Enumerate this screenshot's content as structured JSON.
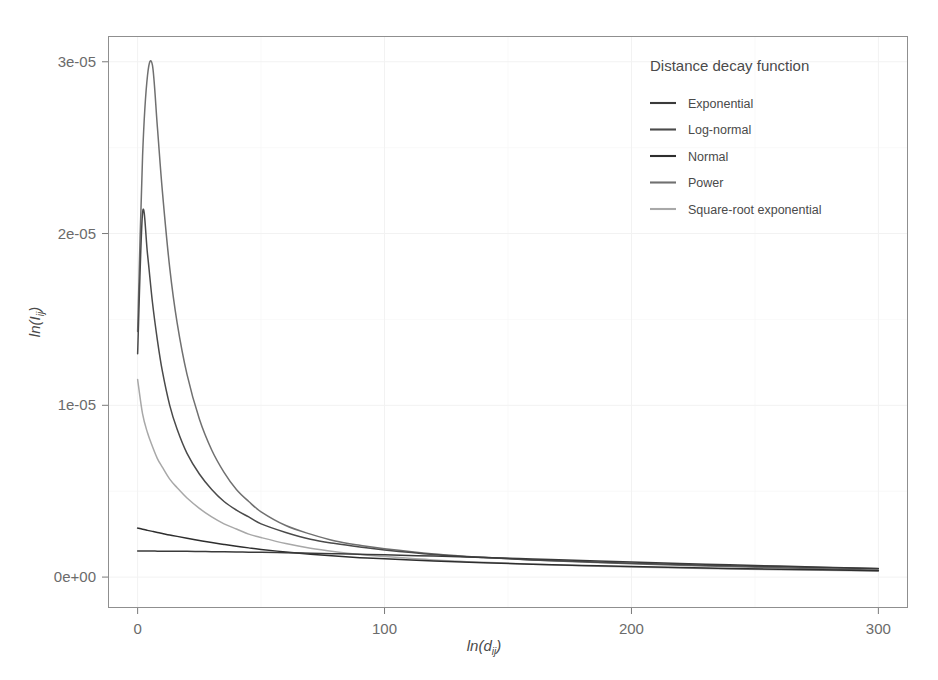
{
  "figure": {
    "background": "#ffffff",
    "panel_background": "#ffffff",
    "panel_border_color": "#8f8f8f",
    "grid_color": "#f2f2f2"
  },
  "legend": {
    "title": "Distance decay function",
    "position": "inside-top-right",
    "entries": [
      {
        "label": "Exponential",
        "color": "#3a3a3a"
      },
      {
        "label": "Log-normal",
        "color": "#4a4a4a"
      },
      {
        "label": "Normal",
        "color": "#2e2e2e"
      },
      {
        "label": "Power",
        "color": "#707070"
      },
      {
        "label": "Square-root exponential",
        "color": "#a8a8a8"
      }
    ]
  },
  "axes": {
    "x": {
      "label": "ln(d",
      "label_sub": "ij",
      "label_close": ")",
      "ticks": [
        "0",
        "100",
        "200",
        "300"
      ],
      "tick_values": [
        0,
        100,
        200,
        300
      ],
      "range": [
        -12,
        312
      ]
    },
    "y": {
      "label": "ln(I",
      "label_sub": "ij",
      "label_close": ")",
      "ticks": [
        "0e+00",
        "1e-05",
        "2e-05",
        "3e-05"
      ],
      "tick_values": [
        0,
        1e-05,
        2e-05,
        3e-05
      ],
      "range": [
        -1.8e-06,
        3.15e-05
      ]
    }
  },
  "chart_data": {
    "type": "line",
    "title": "",
    "xlabel": "ln(d_ij)",
    "ylabel": "ln(I_ij)",
    "xlim": [
      -12,
      312
    ],
    "ylim": [
      -1.8e-06,
      3.15e-05
    ],
    "grid": true,
    "legend_position": "inside-top-right",
    "legend_title": "Distance decay function",
    "x": [
      0,
      2,
      4,
      6,
      8,
      10,
      13,
      16,
      20,
      25,
      30,
      35,
      40,
      45,
      50,
      60,
      70,
      80,
      90,
      100,
      120,
      140,
      160,
      180,
      200,
      230,
      260,
      300
    ],
    "series": [
      {
        "name": "Power",
        "color": "#707070",
        "values": [
          1.43e-05,
          2.45e-05,
          2.92e-05,
          2.98e-05,
          2.62e-05,
          2.25e-05,
          1.8e-05,
          1.48e-05,
          1.18e-05,
          9.2e-06,
          7.4e-06,
          6.1e-06,
          5.1e-06,
          4.4e-06,
          3.8e-06,
          3e-06,
          2.5e-06,
          2.1e-06,
          1.85e-06,
          1.65e-06,
          1.35e-06,
          1.15e-06,
          1e-06,
          8.8e-07,
          7.8e-07,
          6.5e-07,
          5.4e-07,
          4e-07
        ]
      },
      {
        "name": "Log-normal",
        "color": "#4a4a4a",
        "values": [
          1.3e-05,
          2.12e-05,
          1.88e-05,
          1.6e-05,
          1.38e-05,
          1.2e-05,
          1e-05,
          8.6e-06,
          7.2e-06,
          6e-06,
          5.1e-06,
          4.4e-06,
          3.9e-06,
          3.5e-06,
          3.1e-06,
          2.6e-06,
          2.2e-06,
          1.95e-06,
          1.75e-06,
          1.58e-06,
          1.32e-06,
          1.14e-06,
          1e-06,
          9e-07,
          8.1e-07,
          6.9e-07,
          6e-07,
          4.9e-07
        ]
      },
      {
        "name": "Square-root exponential",
        "color": "#a8a8a8",
        "values": [
          1.15e-05,
          9.5e-06,
          8.4e-06,
          7.6e-06,
          6.9e-06,
          6.4e-06,
          5.7e-06,
          5.2e-06,
          4.6e-06,
          4e-06,
          3.5e-06,
          3.1e-06,
          2.8e-06,
          2.5e-06,
          2.3e-06,
          1.95e-06,
          1.68e-06,
          1.48e-06,
          1.32e-06,
          1.2e-06,
          1e-06,
          8.6e-07,
          7.5e-07,
          6.6e-07,
          5.9e-07,
          5e-07,
          4.3e-07,
          3.5e-07
        ]
      },
      {
        "name": "Normal",
        "color": "#2e2e2e",
        "values": [
          2.85e-06,
          2.78e-06,
          2.72e-06,
          2.66e-06,
          2.6e-06,
          2.54e-06,
          2.45e-06,
          2.37e-06,
          2.26e-06,
          2.13e-06,
          2.01e-06,
          1.9e-06,
          1.8e-06,
          1.7e-06,
          1.61e-06,
          1.46e-06,
          1.33e-06,
          1.22e-06,
          1.13e-06,
          1.06e-06,
          9.3e-07,
          8.3e-07,
          7.5e-07,
          6.8e-07,
          6.2e-07,
          5.3e-07,
          4.6e-07,
          3.7e-07
        ]
      },
      {
        "name": "Exponential",
        "color": "#3a3a3a",
        "values": [
          1.52e-06,
          1.52e-06,
          1.52e-06,
          1.52e-06,
          1.51e-06,
          1.51e-06,
          1.51e-06,
          1.5e-06,
          1.5e-06,
          1.49e-06,
          1.48e-06,
          1.47e-06,
          1.46e-06,
          1.45e-06,
          1.44e-06,
          1.42e-06,
          1.39e-06,
          1.36e-06,
          1.33e-06,
          1.3e-06,
          1.22e-06,
          1.14e-06,
          1.05e-06,
          9.6e-07,
          8.8e-07,
          7.5e-07,
          6.4e-07,
          5e-07
        ]
      }
    ]
  }
}
